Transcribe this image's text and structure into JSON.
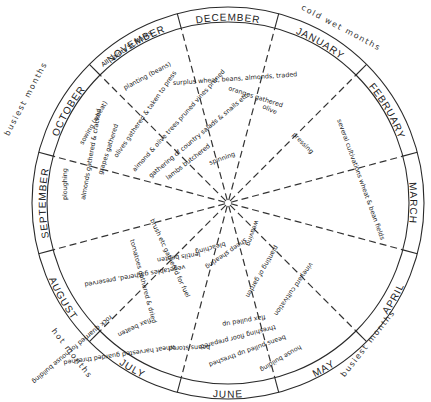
{
  "diagram": {
    "center": [
      228,
      203
    ],
    "outer_radius": 196,
    "inner_radius": 181,
    "months": [
      {
        "label": "JANUARY",
        "angle": 30,
        "flip": false
      },
      {
        "label": "FEBRUARY",
        "angle": 60,
        "flip": false
      },
      {
        "label": "MARCH",
        "angle": 90,
        "flip": false
      },
      {
        "label": "APRIL",
        "angle": 120,
        "flip": true
      },
      {
        "label": "MAY",
        "angle": 150,
        "flip": true
      },
      {
        "label": "JUNE",
        "angle": 180,
        "flip": true
      },
      {
        "label": "JULY",
        "angle": 210,
        "flip": true
      },
      {
        "label": "AUGUST",
        "angle": 240,
        "flip": true
      },
      {
        "label": "SEPTEMBER",
        "angle": 270,
        "flip": false
      },
      {
        "label": "OCTOBER",
        "angle": 300,
        "flip": false
      },
      {
        "label": "NOVEMBER",
        "angle": 330,
        "flip": false
      },
      {
        "label": "DECEMBER",
        "angle": 0,
        "flip": false
      }
    ],
    "seasons": [
      {
        "label": "cold  wet  months",
        "x": 340,
        "y": 30,
        "rotate": 28
      },
      {
        "label": "busiest  months",
        "x": 28,
        "y": 100,
        "rotate": -62
      },
      {
        "label": "hot  months",
        "x": 70,
        "y": 355,
        "rotate": 52
      },
      {
        "label": "busiest  months",
        "x": 370,
        "y": 345,
        "rotate": -52
      }
    ],
    "activities": [
      {
        "text": "All Saints St.Marks",
        "x": 103,
        "y": 67,
        "rotate": -34
      },
      {
        "text": "planting (beans)",
        "x": 125,
        "y": 90,
        "rotate": -28
      },
      {
        "text": "surplus wheat, beans, almonds, traded",
        "x": 173,
        "y": 85,
        "rotate": -4
      },
      {
        "text": "oranges gathered",
        "x": 228,
        "y": 90,
        "rotate": 18
      },
      {
        "text": "olive",
        "x": 262,
        "y": 108,
        "rotate": 25
      },
      {
        "text": "pressing",
        "x": 292,
        "y": 135,
        "rotate": 45
      },
      {
        "text": "several cultivations wheat & bean fields",
        "x": 337,
        "y": 120,
        "rotate": 70
      },
      {
        "text": "sowing (wheat)",
        "x": 83,
        "y": 145,
        "rotate": -60
      },
      {
        "text": "olives gathered & taken to press",
        "x": 117,
        "y": 158,
        "rotate": -55
      },
      {
        "text": "almond & olive trees pruned  vines pruned",
        "x": 135,
        "y": 172,
        "rotate": -48
      },
      {
        "text": "gathering of country salads & snails etc.",
        "x": 151,
        "y": 178,
        "rotate": -40
      },
      {
        "text": "lambs butchered",
        "x": 168,
        "y": 180,
        "rotate": -38
      },
      {
        "text": "spinning",
        "x": 210,
        "y": 165,
        "rotate": -20
      },
      {
        "text": "grapes gathered",
        "x": 102,
        "y": 175,
        "rotate": -72
      },
      {
        "text": "almonds gathered & cracked",
        "x": 85,
        "y": 200,
        "rotate": -80
      },
      {
        "text": "ploughing",
        "x": 67,
        "y": 200,
        "rotate": -90
      },
      {
        "text": "tomatoes gathered & dried",
        "x": 130,
        "y": 240,
        "rotate": 75
      },
      {
        "text": "brush etc gathered for fuel",
        "x": 150,
        "y": 220,
        "rotate": 65
      },
      {
        "text": "vegetables gathered, preserved",
        "x": 185,
        "y": 265,
        "rotate": 170
      },
      {
        "text": "lentils beaten",
        "x": 200,
        "y": 252,
        "rotate": 172
      },
      {
        "text": "rock quarried for house building",
        "x": 110,
        "y": 315,
        "rotate": 140
      },
      {
        "text": "flax beaten",
        "x": 150,
        "y": 318,
        "rotate": 155
      },
      {
        "text": "wheat harvested guarded threshed",
        "x": 175,
        "y": 345,
        "rotate": 172
      },
      {
        "text": "beans stored",
        "x": 210,
        "y": 345,
        "rotate": 178
      },
      {
        "text": "threshing floor prepared",
        "x": 275,
        "y": 325,
        "rotate": 165
      },
      {
        "text": "beans pulled up threshed",
        "x": 285,
        "y": 335,
        "rotate": 160
      },
      {
        "text": "flax pulled up",
        "x": 265,
        "y": 315,
        "rotate": 170
      },
      {
        "text": "house building",
        "x": 300,
        "y": 345,
        "rotate": 150
      },
      {
        "text": "vineyard cultivation",
        "x": 310,
        "y": 262,
        "rotate": 125
      },
      {
        "text": "planting of garden",
        "x": 275,
        "y": 245,
        "rotate": 120
      },
      {
        "text": "sheep shearing",
        "x": 245,
        "y": 238,
        "rotate": 145
      },
      {
        "text": "bleaching",
        "x": 225,
        "y": 242,
        "rotate": 165
      },
      {
        "text": "weaving",
        "x": 255,
        "y": 220,
        "rotate": 110
      }
    ]
  }
}
